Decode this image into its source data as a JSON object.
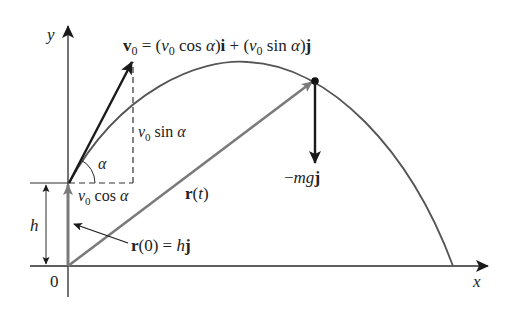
{
  "diagram": {
    "colors": {
      "axis": "#2a2a2a",
      "trajectory": "#555555",
      "position_vector": "#7a7a7a",
      "velocity_vector": "#1a1a1a",
      "force_vector": "#1a1a1a",
      "dashed": "#333333"
    },
    "axes": {
      "x_label": "x",
      "y_label": "y",
      "origin_label": "0"
    },
    "labels": {
      "v0_bold": "v",
      "v0_sub": "0",
      "v0_eq_1": " = (",
      "v0_v": "v",
      "v0_sub2": "0",
      "v0_cos": " cos ",
      "v0_alpha": "α",
      "v0_close_i": ")",
      "i_bold": "i",
      "v0_plus": " + (",
      "v0_v2": "v",
      "v0_sub3": "0",
      "v0_sin": " sin ",
      "v0_alpha2": "α",
      "v0_close_j": ")",
      "j_bold": "j",
      "vsin_v": "v",
      "vsin_sub": "0",
      "vsin_text": " sin ",
      "vsin_alpha": "α",
      "vcos_v": "v",
      "vcos_sub": "0",
      "vcos_text": " cos ",
      "vcos_alpha": "α",
      "alpha": "α",
      "h": "h",
      "r_bold": "r",
      "rt_open": "(",
      "rt_t": "t",
      "rt_close": ")",
      "r0_bold": "r",
      "r0_mid": "(0) = ",
      "r0_h": "h",
      "r0_j": "j",
      "force_minus": "−",
      "force_mg": "mg",
      "force_j": "j"
    }
  }
}
